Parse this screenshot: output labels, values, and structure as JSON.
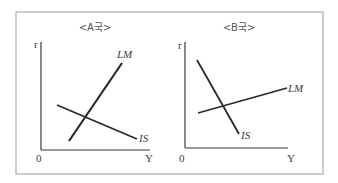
{
  "panels": [
    {
      "title": "<A국>",
      "y_axis_label": "r",
      "x_axis_label": "Y",
      "origin_label": "0",
      "curves": [
        {
          "name": "LM",
          "label": "LM",
          "slope": "steep-positive"
        },
        {
          "name": "IS",
          "label": "IS",
          "slope": "gentle-negative"
        }
      ]
    },
    {
      "title": "<B국>",
      "y_axis_label": "r",
      "x_axis_label": "Y",
      "origin_label": "0",
      "curves": [
        {
          "name": "IS",
          "label": "IS",
          "slope": "steep-negative"
        },
        {
          "name": "LM",
          "label": "LM",
          "slope": "gentle-positive"
        }
      ]
    }
  ],
  "colors": {
    "frame": "#b8b8b8",
    "lines": "#2a2a2a",
    "text": "#3a3a3a"
  }
}
